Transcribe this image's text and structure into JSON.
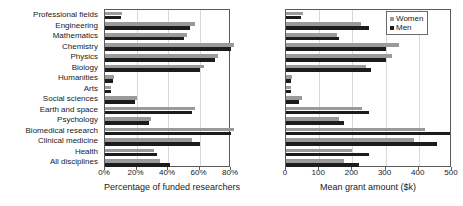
{
  "chart_data": [
    {
      "id": "left",
      "type": "bar",
      "orientation": "horizontal",
      "title": "",
      "xlabel": "Percentage of funded researchers",
      "ylabel": "",
      "xlim": [
        0,
        80
      ],
      "xticks": [
        0,
        20,
        40,
        60,
        80
      ],
      "xtick_labels": [
        "0%",
        "20%",
        "40%",
        "60%",
        "80%"
      ],
      "grid": true,
      "grid_axis": "x",
      "legend": false,
      "categories": [
        "Professional fields",
        "Engineering",
        "Mathematics",
        "Chemistry",
        "Physics",
        "Biology",
        "Humanities",
        "Arts",
        "Social sciences",
        "Earth and space",
        "Psychology",
        "Biomedical research",
        "Clinical medicine",
        "Health",
        "All disciplines"
      ],
      "series": [
        {
          "name": "Women",
          "color": "#9a9a9a",
          "values": [
            11,
            57,
            52,
            82,
            72,
            63,
            6,
            4,
            20,
            57,
            29,
            82,
            55,
            31,
            35
          ]
        },
        {
          "name": "Men",
          "color": "#1c1c1c",
          "values": [
            10,
            54,
            50,
            80,
            70,
            60,
            5,
            4,
            19,
            55,
            28,
            80,
            60,
            33,
            41
          ]
        }
      ]
    },
    {
      "id": "right",
      "type": "bar",
      "orientation": "horizontal",
      "title": "",
      "xlabel": "Mean grant amount ($k)",
      "ylabel": "",
      "xlim": [
        0,
        500
      ],
      "xticks": [
        0,
        100,
        200,
        300,
        400,
        500
      ],
      "xtick_labels": [
        "0",
        "100",
        "200",
        "300",
        "400",
        "500"
      ],
      "grid": true,
      "grid_axis": "x",
      "legend": true,
      "legend_position": "upper right",
      "categories": [
        "Professional fields",
        "Engineering",
        "Mathematics",
        "Chemistry",
        "Physics",
        "Biology",
        "Humanities",
        "Arts",
        "Social sciences",
        "Earth and space",
        "Psychology",
        "Biomedical research",
        "Clinical medicine",
        "Health",
        "All disciplines"
      ],
      "series": [
        {
          "name": "Women",
          "color": "#9a9a9a",
          "values": [
            52,
            225,
            155,
            340,
            320,
            240,
            18,
            16,
            48,
            230,
            160,
            420,
            385,
            200,
            175
          ]
        },
        {
          "name": "Men",
          "color": "#1c1c1c",
          "values": [
            45,
            250,
            160,
            300,
            300,
            255,
            16,
            14,
            40,
            250,
            175,
            495,
            455,
            250,
            220
          ]
        }
      ]
    }
  ],
  "legend": {
    "items": [
      {
        "label": "Women",
        "color": "#9a9a9a"
      },
      {
        "label": "Men",
        "color": "#1c1c1c"
      }
    ]
  },
  "colors": {
    "women": "#9a9a9a",
    "men": "#1c1c1c",
    "axis": "#5a5a5a",
    "grid": "#d9d9d9",
    "background": "#ffffff",
    "text": "#1a1a1a"
  }
}
